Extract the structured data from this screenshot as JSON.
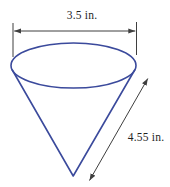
{
  "figure": {
    "type": "cone-diagram",
    "labels": {
      "diameter": "3.5 in.",
      "slant": "4.55 in."
    },
    "colors": {
      "cone_stroke": "#3b4a9c",
      "dimension_stroke": "#3f3f3f",
      "label_text": "#1f1f1f",
      "background": "#ffffff"
    }
  }
}
